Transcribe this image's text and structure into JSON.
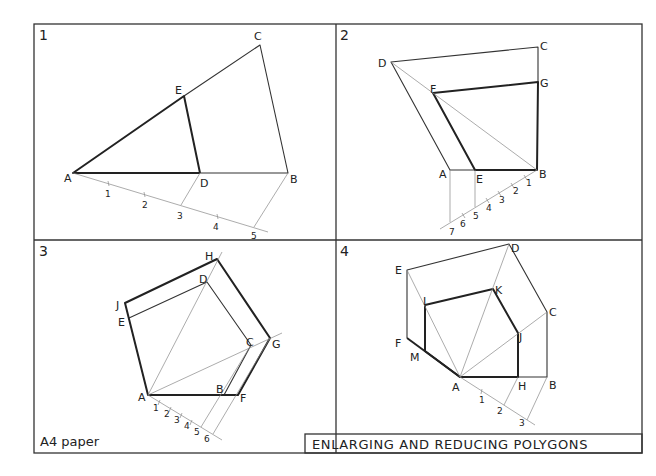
{
  "sheet": {
    "paper_label": "A4 paper",
    "title": "ENLARGING AND REDUCING POLYGONS",
    "colors": {
      "line": "#222222",
      "construction": "#888888",
      "background": "#ffffff"
    }
  },
  "panels": [
    {
      "number": "1",
      "labels": {
        "A": "A",
        "B": "B",
        "C": "C",
        "D": "D",
        "E": "E"
      },
      "divisions": [
        "1",
        "2",
        "3",
        "4",
        "5"
      ]
    },
    {
      "number": "2",
      "labels": {
        "A": "A",
        "B": "B",
        "C": "C",
        "D": "D",
        "E": "E",
        "F": "F",
        "G": "G"
      },
      "divisions": [
        "1",
        "2",
        "3",
        "4",
        "5",
        "6",
        "7"
      ]
    },
    {
      "number": "3",
      "labels": {
        "A": "A",
        "B": "B",
        "C": "C",
        "D": "D",
        "E": "E",
        "F": "F",
        "G": "G",
        "H": "H",
        "J": "J"
      },
      "divisions": [
        "1",
        "2",
        "3",
        "4",
        "5",
        "6"
      ]
    },
    {
      "number": "4",
      "labels": {
        "A": "A",
        "B": "B",
        "C": "C",
        "D": "D",
        "E": "E",
        "F": "F",
        "H": "H",
        "J": "J",
        "K": "K",
        "L": "L",
        "M": "M"
      },
      "divisions": [
        "1",
        "2",
        "3"
      ]
    }
  ]
}
